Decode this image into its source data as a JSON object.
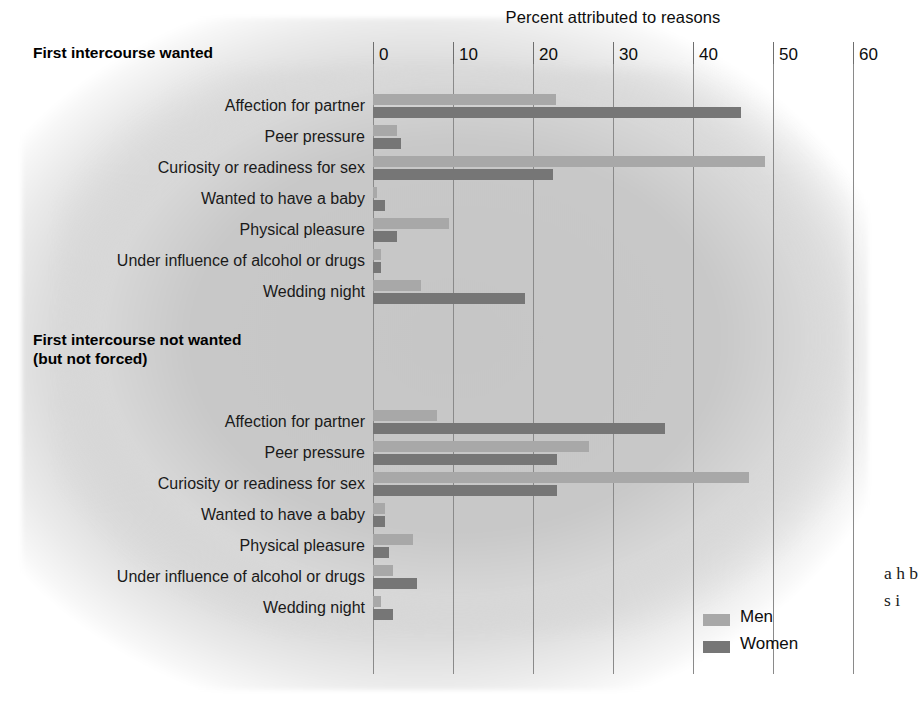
{
  "chart_data": {
    "type": "bar",
    "orientation": "horizontal",
    "title": "Percent attributed to reasons",
    "xlabel": "Percent attributed to reasons",
    "ylabel": "",
    "xlim": [
      0,
      60
    ],
    "xticks": [
      0,
      10,
      20,
      30,
      40,
      50,
      60
    ],
    "grid": true,
    "legend_position": "bottom-right",
    "legend": [
      "Men",
      "Women"
    ],
    "colors": {
      "men": "#a8a8a8",
      "women": "#767676",
      "background": "#c9c9c9"
    },
    "groups": [
      {
        "title": "First intercourse wanted",
        "categories": [
          "Affection for partner",
          "Peer pressure",
          "Curiosity or readiness for sex",
          "Wanted to have a baby",
          "Physical pleasure",
          "Under influence of alcohol or drugs",
          "Wedding night"
        ],
        "series": [
          {
            "name": "Men",
            "values": [
              22.9,
              3.0,
              49.0,
              0.5,
              9.5,
              1.0,
              6.0
            ]
          },
          {
            "name": "Women",
            "values": [
              46.0,
              3.5,
              22.5,
              1.5,
              3.0,
              1.0,
              19.0
            ]
          }
        ]
      },
      {
        "title": "First intercourse not wanted\n(but not forced)",
        "categories": [
          "Affection for partner",
          "Peer pressure",
          "Curiosity or readiness for sex",
          "Wanted to have a baby",
          "Physical pleasure",
          "Under influence of alcohol or drugs",
          "Wedding night"
        ],
        "series": [
          {
            "name": "Men",
            "values": [
              8.0,
              27.0,
              47.0,
              1.5,
              5.0,
              2.5,
              1.0
            ]
          },
          {
            "name": "Women",
            "values": [
              36.5,
              23.0,
              23.0,
              1.5,
              2.0,
              5.5,
              2.5
            ]
          }
        ]
      }
    ]
  },
  "axis": {
    "title": "Percent attributed to reasons",
    "ticks": [
      "0",
      "10",
      "20",
      "30",
      "40",
      "50",
      "60"
    ]
  },
  "sections": {
    "first": {
      "title": "First intercourse wanted"
    },
    "second": {
      "title": "First intercourse not wanted\n(but not forced)"
    }
  },
  "legend": {
    "men": "Men",
    "women": "Women"
  },
  "margin_text": "a\nh\nb\ns\ni"
}
